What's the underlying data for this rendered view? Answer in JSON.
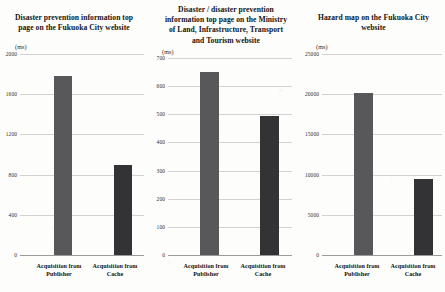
{
  "figure": {
    "unit_label": "(ms)",
    "categories": [
      "Acquisition from Publisher",
      "Acquisition from Cache"
    ],
    "category_line1": "Acquisition from",
    "category_2_line1": "Acquisition from",
    "cat1_line2": "Publisher",
    "cat2_line2": "Cache",
    "colors": {
      "bar_publisher": "#58585a",
      "bar_cache": "#333335",
      "gridline": "#d2d2d2",
      "axis": "#9a9a9a",
      "background": "#fdfdfb",
      "text": "#141414"
    }
  },
  "chart_data": [
    {
      "type": "bar",
      "title": "Disaster prevention information top page on the Fukuoka City website",
      "title_lines": [
        "Disaster prevention information top",
        "page on the Fukuoka City website"
      ],
      "xlabel": "",
      "ylabel": "(ms)",
      "categories": [
        "Acquisition from Publisher",
        "Acquisition from Cache"
      ],
      "values": [
        1780,
        900
      ],
      "ylim": [
        0,
        2000
      ],
      "yticks": [
        0,
        400,
        800,
        1200,
        1600,
        2000
      ],
      "ytick_labels": [
        "0",
        "400",
        "800",
        "1200",
        "1600",
        "2000"
      ],
      "grid": true,
      "legend": "none"
    },
    {
      "type": "bar",
      "title": "Disaster / disaster prevention information top page on the Ministry of Land, Infrastructure, Transport and Tourism website",
      "title_lines": [
        "Disaster / disaster prevention",
        "information top page on the Ministry",
        "of Land, Infrastructure, Transport",
        "and Tourism website"
      ],
      "xlabel": "",
      "ylabel": "(ms)",
      "categories": [
        "Acquisition from Publisher",
        "Acquisition from Cache"
      ],
      "values": [
        650,
        495
      ],
      "ylim": [
        0,
        700
      ],
      "yticks": [
        0,
        100,
        200,
        300,
        400,
        500,
        600,
        700
      ],
      "ytick_labels": [
        "0",
        "100",
        "200",
        "300",
        "400",
        "500",
        "600",
        "700"
      ],
      "grid": true,
      "legend": "none"
    },
    {
      "type": "bar",
      "title": "Hazard map on the Fukuoka City website",
      "title_lines": [
        "Hazard map on the Fukuoka City",
        "website"
      ],
      "xlabel": "",
      "ylabel": "(ms)",
      "categories": [
        "Acquisition from Publisher",
        "Acquisition from Cache"
      ],
      "values": [
        20100,
        9400
      ],
      "ylim": [
        0,
        25000
      ],
      "yticks": [
        0,
        5000,
        10000,
        15000,
        20000,
        25000
      ],
      "ytick_labels": [
        "0",
        "5000",
        "10000",
        "15000",
        "20000",
        "25000"
      ],
      "grid": true,
      "legend": "none"
    }
  ]
}
